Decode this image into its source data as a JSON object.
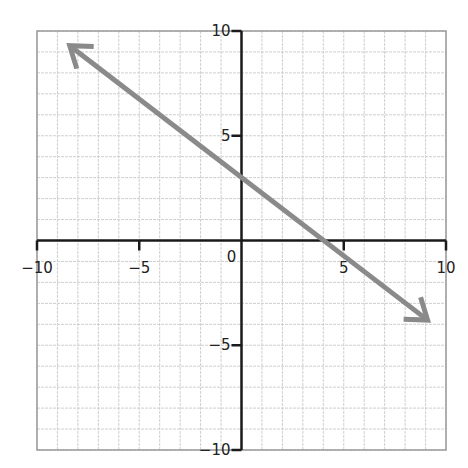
{
  "chart_data": {
    "type": "line",
    "title": "",
    "xlabel": "",
    "ylabel": "",
    "xlim": [
      -10,
      10
    ],
    "ylim": [
      -10,
      10
    ],
    "grid": true,
    "grid_step": 1,
    "x_ticks": [
      -10,
      -5,
      0,
      5,
      10
    ],
    "y_ticks": [
      -10,
      -5,
      5,
      10
    ],
    "x_tick_labels": [
      "−10",
      "−5",
      "0",
      "5",
      "10"
    ],
    "y_tick_labels": [
      "−10",
      "−5",
      "5",
      "10"
    ],
    "origin_label": "0",
    "series": [
      {
        "name": "line",
        "equation": "y = -0.75x + 3",
        "slope": -0.75,
        "intercept": 3,
        "x": [
          -8.4,
          9.1
        ],
        "y": [
          9.3,
          -3.8
        ],
        "arrows_both_ends": true,
        "color": "#8a8a8a"
      }
    ]
  },
  "colors": {
    "grid": "#cfcfcf",
    "axis": "#1a1a1a",
    "line": "#8a8a8a",
    "border": "#9a9a9a"
  }
}
